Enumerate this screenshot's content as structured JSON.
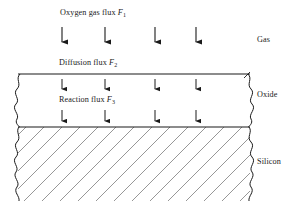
{
  "figure": {
    "background_color": "#ffffff",
    "line_color": "#1a1a1a",
    "hatch_color": "#6a6a6a"
  },
  "flux_labels": {
    "oxygen": {
      "text": "Oxygen gas flux ",
      "symbol": "F",
      "subscript": "1"
    },
    "diffusion": {
      "text": "Diffusion flux ",
      "symbol": "F",
      "subscript": "2"
    },
    "reaction": {
      "text": "Reaction flux ",
      "symbol": "F",
      "subscript": "3"
    }
  },
  "region_labels": {
    "gas": "Gas",
    "oxide": "Oxide",
    "silicon": "Silicon"
  },
  "arrow_groups": [
    {
      "name": "oxygen-gas-flux-arrows",
      "count": 4,
      "x_positions": [
        62,
        105,
        155,
        196
      ],
      "y_start": 27,
      "y_end": 48
    },
    {
      "name": "diffusion-flux-arrows",
      "count": 4,
      "x_positions": [
        62,
        105,
        155,
        196
      ],
      "y_start": 79,
      "y_end": 95
    },
    {
      "name": "reaction-flux-arrows",
      "count": 4,
      "x_positions": [
        62,
        105,
        155,
        196
      ],
      "y_start": 110,
      "y_end": 126
    }
  ],
  "boundaries": {
    "oxide_top_y": 74,
    "oxide_silicon_interface_y": 127,
    "silicon_bottom_y": 201,
    "left_edge_x": 18,
    "right_edge_x": 250
  }
}
